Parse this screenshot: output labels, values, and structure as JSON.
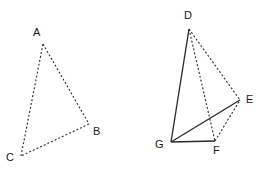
{
  "figure": {
    "background_color": "#ffffff",
    "stroke_color": "#2b2b2b",
    "label_color": "#1a1a1a",
    "width": 265,
    "height": 173,
    "shapes": [
      {
        "name": "triangle-abc",
        "kind": "triangle",
        "vertices": [
          {
            "id": "A",
            "label": "A",
            "x": 43,
            "y": 44,
            "label_x": 33,
            "label_y": 27
          },
          {
            "id": "B",
            "label": "B",
            "x": 89,
            "y": 124,
            "label_x": 93,
            "label_y": 126
          },
          {
            "id": "C",
            "label": "C",
            "x": 21,
            "y": 156,
            "label_x": 6,
            "label_y": 152
          }
        ],
        "edges": [
          {
            "from": "A",
            "to": "B",
            "style": "dashed"
          },
          {
            "from": "B",
            "to": "C",
            "style": "dashed"
          },
          {
            "from": "C",
            "to": "A",
            "style": "dashed"
          }
        ]
      },
      {
        "name": "tetrahedron-defg",
        "kind": "tetrahedron",
        "vertices": [
          {
            "id": "D",
            "label": "D",
            "x": 189,
            "y": 29,
            "label_x": 184,
            "label_y": 10
          },
          {
            "id": "E",
            "label": "E",
            "x": 240,
            "y": 100,
            "label_x": 246,
            "label_y": 94
          },
          {
            "id": "F",
            "label": "F",
            "x": 215,
            "y": 141,
            "label_x": 213,
            "label_y": 145
          },
          {
            "id": "G",
            "label": "G",
            "x": 171,
            "y": 142,
            "label_x": 155,
            "label_y": 139
          }
        ],
        "edges": [
          {
            "from": "D",
            "to": "G",
            "style": "solid"
          },
          {
            "from": "D",
            "to": "E",
            "style": "dashed"
          },
          {
            "from": "D",
            "to": "F",
            "style": "dashed"
          },
          {
            "from": "G",
            "to": "E",
            "style": "solid"
          },
          {
            "from": "G",
            "to": "F",
            "style": "solid"
          },
          {
            "from": "F",
            "to": "E",
            "style": "dashed"
          }
        ]
      }
    ]
  }
}
